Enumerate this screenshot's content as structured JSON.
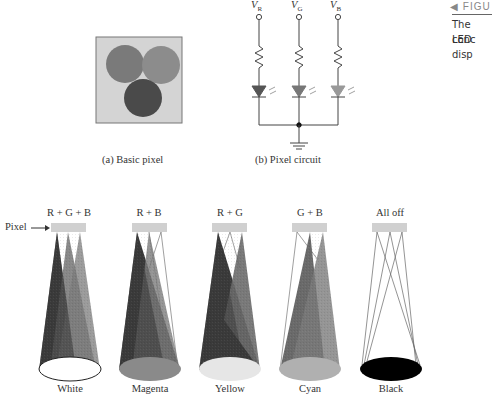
{
  "figure_note": {
    "tag": "◀ FIGU",
    "lines": [
      "The conc",
      "LED disp"
    ]
  },
  "panel_a": {
    "caption": "(a) Basic pixel",
    "colors": {
      "background": "#d4d4d4",
      "circle_left": "#7a7a7a",
      "circle_right": "#8c8c8c",
      "circle_bottom": "#4a4a4a",
      "border": "#777777"
    }
  },
  "panel_b": {
    "caption": "(b) Pixel circuit",
    "voltages": [
      {
        "name": "V",
        "sub": "R"
      },
      {
        "name": "V",
        "sub": "G"
      },
      {
        "name": "V",
        "sub": "B"
      }
    ],
    "led_colors": [
      "#555555",
      "#777777",
      "#999999"
    ]
  },
  "pixel_label": "Pixel",
  "cones": [
    {
      "title": "R + G + B",
      "result": "White",
      "base_color": "#ffffff"
    },
    {
      "title": "R + B",
      "result": "Magenta",
      "base_color": "#8a8a8a"
    },
    {
      "title": "R + G",
      "result": "Yellow",
      "base_color": "#e6e6e6"
    },
    {
      "title": "G + B",
      "result": "Cyan",
      "base_color": "#b0b0b0"
    },
    {
      "title": "All off",
      "result": "Black",
      "base_color": "#000000"
    }
  ]
}
